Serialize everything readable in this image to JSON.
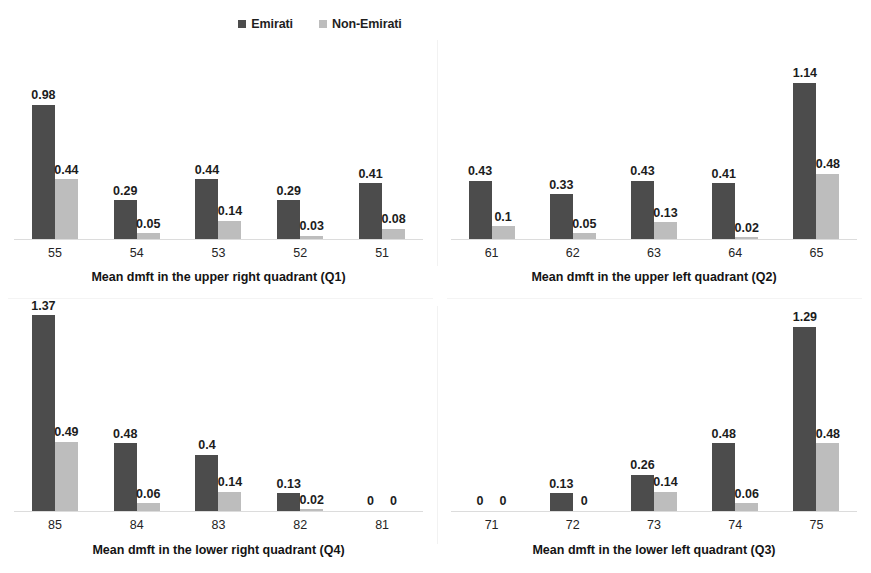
{
  "legend": {
    "entries": [
      {
        "label": "Emirati",
        "color": "#4c4c4c",
        "icon": "square-marker-icon"
      },
      {
        "label": "Non-Emirati",
        "color": "#bdbdbd",
        "icon": "square-marker-icon"
      }
    ]
  },
  "colors": {
    "emirati": "#4c4c4c",
    "non_emirati": "#bdbdbd",
    "baseline": "#dcdcdc",
    "text": "#1a1a1a",
    "background": "#ffffff"
  },
  "chart_data": [
    {
      "type": "bar",
      "title": "",
      "xlabel": "Mean dmft in the upper right quadrant (Q1)",
      "ylabel": "",
      "categories": [
        "55",
        "54",
        "53",
        "52",
        "51"
      ],
      "ylim": [
        0,
        1.45
      ],
      "grid": false,
      "legend_position": "top-center",
      "series": [
        {
          "name": "Emirati",
          "color": "#4c4c4c",
          "values": [
            0.98,
            0.29,
            0.44,
            0.29,
            0.41
          ],
          "labels": [
            "0.98",
            "0.29",
            "0.44",
            "0.29",
            "0.41"
          ]
        },
        {
          "name": "Non-Emirati",
          "color": "#bdbdbd",
          "values": [
            0.44,
            0.05,
            0.14,
            0.03,
            0.08
          ],
          "labels": [
            "0.44",
            "0.05",
            "0.14",
            "0.03",
            "0.08"
          ]
        }
      ]
    },
    {
      "type": "bar",
      "title": "",
      "xlabel": "Mean dmft in the upper left quadrant (Q2)",
      "ylabel": "",
      "categories": [
        "61",
        "62",
        "63",
        "64",
        "65"
      ],
      "ylim": [
        0,
        1.45
      ],
      "grid": false,
      "legend_position": "top-center",
      "series": [
        {
          "name": "Emirati",
          "color": "#4c4c4c",
          "values": [
            0.43,
            0.33,
            0.43,
            0.41,
            1.14
          ],
          "labels": [
            "0.43",
            "0.33",
            "0.43",
            "0.41",
            "1.14"
          ]
        },
        {
          "name": "Non-Emirati",
          "color": "#bdbdbd",
          "values": [
            0.1,
            0.05,
            0.13,
            0.02,
            0.48
          ],
          "labels": [
            "0.1",
            "0.05",
            "0.13",
            "0.02",
            "0.48"
          ]
        }
      ]
    },
    {
      "type": "bar",
      "title": "",
      "xlabel": "Mean dmft in the lower right quadrant (Q4)",
      "ylabel": "",
      "categories": [
        "85",
        "84",
        "83",
        "82",
        "81"
      ],
      "ylim": [
        0,
        1.45
      ],
      "grid": false,
      "legend_position": "top-center",
      "series": [
        {
          "name": "Emirati",
          "color": "#4c4c4c",
          "values": [
            1.37,
            0.48,
            0.4,
            0.13,
            0
          ],
          "labels": [
            "1.37",
            "0.48",
            "0.4",
            "0.13",
            "0"
          ]
        },
        {
          "name": "Non-Emirati",
          "color": "#bdbdbd",
          "values": [
            0.49,
            0.06,
            0.14,
            0.02,
            0
          ],
          "labels": [
            "0.49",
            "0.06",
            "0.14",
            "0.02",
            "0"
          ]
        }
      ]
    },
    {
      "type": "bar",
      "title": "",
      "xlabel": "Mean dmft in the lower left quadrant (Q3)",
      "ylabel": "",
      "categories": [
        "71",
        "72",
        "73",
        "74",
        "75"
      ],
      "ylim": [
        0,
        1.45
      ],
      "grid": false,
      "legend_position": "top-center",
      "series": [
        {
          "name": "Emirati",
          "color": "#4c4c4c",
          "values": [
            0,
            0.13,
            0.26,
            0.48,
            1.29
          ],
          "labels": [
            "0",
            "0.13",
            "0.26",
            "0.48",
            "1.29"
          ]
        },
        {
          "name": "Non-Emirati",
          "color": "#bdbdbd",
          "values": [
            0,
            0,
            0.14,
            0.06,
            0.48
          ],
          "labels": [
            "0",
            "0",
            "0.14",
            "0.06",
            "0.48"
          ]
        }
      ]
    }
  ]
}
